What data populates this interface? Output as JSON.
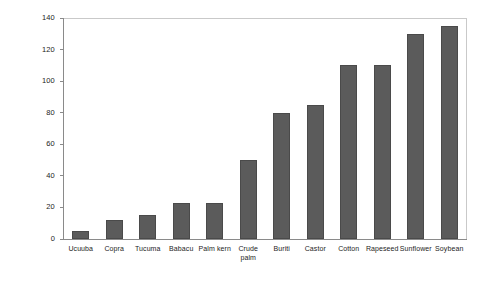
{
  "chart_data": {
    "type": "bar",
    "title": "",
    "xlabel": "",
    "ylabel": "Iodine Index",
    "ylim": [
      0,
      140
    ],
    "yticks": [
      0,
      20,
      40,
      60,
      80,
      100,
      120,
      140
    ],
    "grid": false,
    "legend": "none",
    "bar_color": "#5b5b5b",
    "bar_edge_color": "#4a4a4a",
    "frame_color": "#c9c9c9",
    "axis_color": "#8a8a8a",
    "categories": [
      "Ucuuba",
      "Copra",
      "Tucuma",
      "Babacu",
      "Palm kern",
      "Crude\npalm",
      "Buriti",
      "Castor",
      "Cotton",
      "Rapeseed",
      "Sunflower",
      "Soybean"
    ],
    "values": [
      5,
      12,
      15,
      23,
      23,
      50,
      80,
      85,
      110,
      110,
      130,
      135
    ]
  }
}
